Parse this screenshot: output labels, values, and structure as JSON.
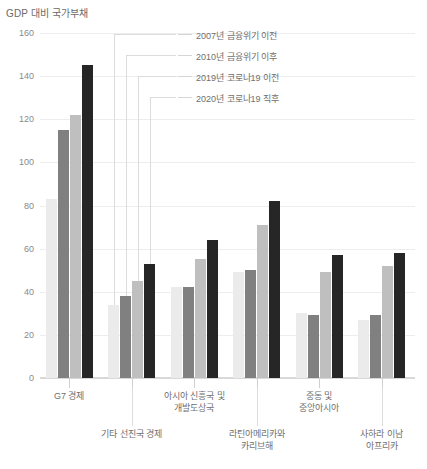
{
  "chart_data": {
    "type": "bar",
    "title": "GDP 대비 국가부채",
    "xlabel": "",
    "ylabel": "",
    "ylim": [
      0,
      160
    ],
    "ytick_values": [
      0,
      20,
      40,
      60,
      80,
      100,
      120,
      140,
      160
    ],
    "ytick_labels": [
      "0",
      "20",
      "40",
      "60",
      "80",
      "100",
      "120",
      "140",
      "160"
    ],
    "grid": true,
    "legend_position": "top-right",
    "categories": [
      "G7 경제",
      "기타 선진국 경제",
      "아시아 신흥국 및\n개발도상국",
      "라틴아메리카와\n카리브해",
      "중동 및\n중앙아시아",
      "사하라 이남\n아프리카"
    ],
    "series": [
      {
        "name": "2007년 금융위기 이전",
        "color": "#ebebeb",
        "values": [
          83,
          34,
          42,
          49,
          30,
          27
        ]
      },
      {
        "name": "2010년 금융위기 이후",
        "color": "#808080",
        "values": [
          115,
          38,
          42,
          50,
          29,
          29
        ]
      },
      {
        "name": "2019년 코로나19 이전",
        "color": "#bfbfbf",
        "values": [
          122,
          45,
          55,
          71,
          49,
          52
        ]
      },
      {
        "name": "2020년 코로나19 직후",
        "color": "#262626",
        "values": [
          145,
          53,
          64,
          82,
          57,
          58
        ]
      }
    ]
  }
}
